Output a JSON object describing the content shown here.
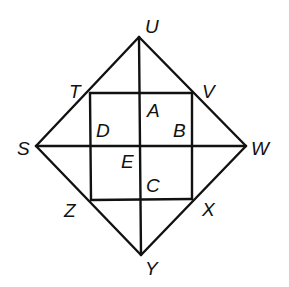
{
  "diagram": {
    "type": "geometry",
    "points": {
      "U": {
        "x": 139,
        "y": 37
      },
      "S": {
        "x": 36,
        "y": 146
      },
      "W": {
        "x": 246,
        "y": 146
      },
      "Y": {
        "x": 141,
        "y": 255
      },
      "T": {
        "x": 90,
        "y": 93
      },
      "V": {
        "x": 192,
        "y": 93
      },
      "X": {
        "x": 192,
        "y": 199
      },
      "Z": {
        "x": 91,
        "y": 200
      },
      "E": {
        "x": 141,
        "y": 146
      }
    },
    "segments": [
      [
        "S",
        "U"
      ],
      [
        "U",
        "W"
      ],
      [
        "W",
        "Y"
      ],
      [
        "Y",
        "S"
      ],
      [
        "T",
        "V"
      ],
      [
        "V",
        "X"
      ],
      [
        "X",
        "Z"
      ],
      [
        "Z",
        "T"
      ],
      [
        "S",
        "W"
      ],
      [
        "U",
        "Y"
      ]
    ],
    "labels": {
      "U": "U",
      "V": "V",
      "W": "W",
      "X": "X",
      "Y": "Y",
      "Z": "Z",
      "S": "S",
      "T": "T",
      "A": "A",
      "B": "B",
      "C": "C",
      "D": "D",
      "E": "E"
    },
    "colors": {
      "line": "#111111",
      "background": "#ffffff"
    }
  }
}
